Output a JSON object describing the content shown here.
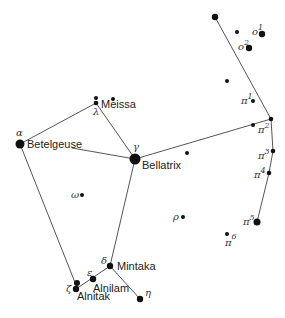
{
  "diagram": {
    "colors": {
      "star": "#111111",
      "line": "#555555",
      "text": "#222222"
    },
    "stars": [
      {
        "id": "betelgeuse",
        "greek": "α",
        "name": "Betelgeuse",
        "x": 20,
        "y": 144,
        "r": 4.5
      },
      {
        "id": "bellatrix",
        "greek": "γ",
        "name": "Bellatrix",
        "x": 135,
        "y": 159,
        "r": 5.5
      },
      {
        "id": "meissa",
        "greek": "λ",
        "name": "Meissa",
        "x": 96,
        "y": 103,
        "r": 2.3
      },
      {
        "id": "meissa-b",
        "greek": "",
        "name": "",
        "x": 96,
        "y": 98,
        "r": 2
      },
      {
        "id": "phi2",
        "greek": "",
        "name": "",
        "x": 113,
        "y": 99,
        "r": 2
      },
      {
        "id": "mintaka",
        "greek": "δ",
        "name": "Mintaka",
        "x": 110,
        "y": 266,
        "r": 3.2
      },
      {
        "id": "alnilam",
        "greek": "ε",
        "name": "Alnilam",
        "x": 93,
        "y": 279,
        "r": 3.2
      },
      {
        "id": "alnitak",
        "greek": "ζ",
        "name": "Alnitak",
        "x": 76,
        "y": 289,
        "r": 3.2
      },
      {
        "id": "alnitak-b",
        "greek": "",
        "name": "",
        "x": 77,
        "y": 283,
        "r": 3
      },
      {
        "id": "eta",
        "greek": "η",
        "name": "",
        "x": 140,
        "y": 299,
        "r": 3.2
      },
      {
        "id": "omega",
        "greek": "ω",
        "name": "",
        "x": 82,
        "y": 195,
        "r": 2
      },
      {
        "id": "rho",
        "greek": "ρ",
        "name": "",
        "x": 183,
        "y": 217,
        "r": 2
      },
      {
        "id": "top",
        "greek": "",
        "name": "",
        "x": 215,
        "y": 17,
        "r": 3.2
      },
      {
        "id": "chi",
        "greek": "",
        "name": "",
        "x": 237,
        "y": 32,
        "r": 2
      },
      {
        "id": "o1",
        "greek": "o",
        "sup": "1",
        "name": "",
        "x": 262,
        "y": 34,
        "r": 3.2
      },
      {
        "id": "o2",
        "greek": "o",
        "sup": "2",
        "name": "",
        "x": 249,
        "y": 48,
        "r": 3.2
      },
      {
        "id": "unnamed1",
        "greek": "",
        "name": "",
        "x": 227,
        "y": 81,
        "r": 2
      },
      {
        "id": "pi1",
        "greek": "π",
        "sup": "1",
        "name": "",
        "x": 253,
        "y": 101,
        "r": 2
      },
      {
        "id": "pi2",
        "greek": "π",
        "sup": "2",
        "name": "",
        "x": 271,
        "y": 119,
        "r": 2.3
      },
      {
        "id": "pi2-near",
        "greek": "",
        "name": "",
        "x": 253,
        "y": 125,
        "r": 2
      },
      {
        "id": "pi3",
        "greek": "π",
        "sup": "3",
        "name": "",
        "x": 273,
        "y": 151,
        "r": 2.3
      },
      {
        "id": "pi4",
        "greek": "π",
        "sup": "4",
        "name": "",
        "x": 269,
        "y": 173,
        "r": 2.3
      },
      {
        "id": "pi5",
        "greek": "π",
        "sup": "5",
        "name": "",
        "x": 257,
        "y": 222,
        "r": 3.5
      },
      {
        "id": "pi6",
        "greek": "π",
        "sup": "6",
        "name": "",
        "x": 227,
        "y": 234,
        "r": 2
      },
      {
        "id": "unnamed2",
        "greek": "",
        "name": "",
        "x": 187,
        "y": 153,
        "r": 2
      }
    ],
    "labels": {
      "betelgeuse": "Betelgeuse",
      "bellatrix": "Bellatrix",
      "meissa": "Meissa",
      "mintaka": "Mintaka",
      "alnilam": "Alnilam",
      "alnitak": "Alnitak",
      "alpha": "α",
      "gamma": "γ",
      "lambda": "λ",
      "delta": "δ",
      "epsilon": "ε",
      "zeta": "ζ",
      "eta": "η",
      "omega": "ω",
      "rho": "ρ",
      "omicron": "o",
      "pi": "π",
      "sup1": "1",
      "sup2": "2",
      "sup3": "3",
      "sup4": "4",
      "sup5": "5",
      "sup6": "6"
    }
  }
}
